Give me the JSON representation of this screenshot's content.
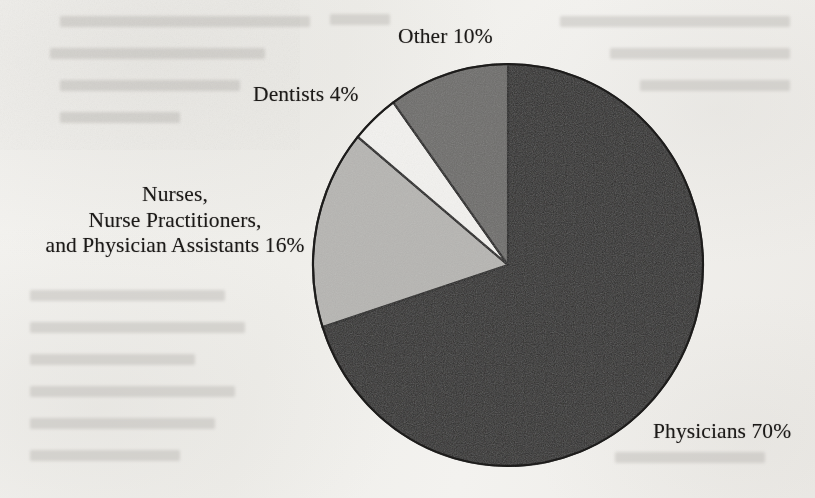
{
  "figure": {
    "background_color": "#f2f1ed",
    "medium": "scanned-book-page"
  },
  "chart_data": {
    "type": "pie",
    "title": "",
    "subtitle": "",
    "xlabel": "",
    "ylabel": "",
    "legend_position": "none",
    "grid": false,
    "labels_on_slices": false,
    "start_angle_deg": 0,
    "direction": "clockwise",
    "categories": [
      "Physicians",
      "Nurses, Nurse Practitioners, and Physician Assistants",
      "Dentists",
      "Other"
    ],
    "values": [
      70,
      16,
      4,
      10
    ],
    "units": "percent",
    "total": 100,
    "slices": [
      {
        "name": "Physicians",
        "value": 70,
        "value_text": "70%",
        "label_text": "Physicians 70%",
        "color": "#2e2d2c",
        "start_deg": 0,
        "end_deg": 252
      },
      {
        "name": "Nurses, Nurse Practitioners, and Physician Assistants",
        "value": 16,
        "value_text": "16%",
        "label_lines": [
          "Nurses,",
          "Nurse Practitioners,",
          "and Physician Assistants 16%"
        ],
        "color": "#b6b5b2",
        "start_deg": 252,
        "end_deg": 309.6
      },
      {
        "name": "Dentists",
        "value": 4,
        "value_text": "4%",
        "label_text": "Dentists 4%",
        "color": "#f3f2ef",
        "start_deg": 309.6,
        "end_deg": 324
      },
      {
        "name": "Other",
        "value": 10,
        "value_text": "10%",
        "label_text": "Other 10%",
        "color": "#6d6c6a",
        "start_deg": 324,
        "end_deg": 360
      }
    ]
  },
  "labels": {
    "other": "Other 10%",
    "dentists": "Dentists 4%",
    "nurses": {
      "line1": "Nurses,",
      "line2": "Nurse Practitioners,",
      "line3": "and Physician Assistants 16%"
    },
    "physicians": "Physicians 70%"
  },
  "geometry": {
    "center_x": 508,
    "center_y": 265,
    "radius_x": 195,
    "radius_y": 201,
    "outline_color": "#1d1c1b"
  }
}
